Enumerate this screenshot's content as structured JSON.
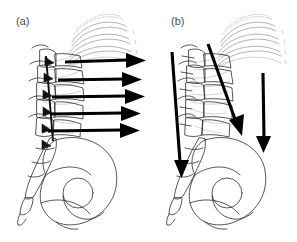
{
  "figure": {
    "background_color": "#ffffff",
    "width": 297,
    "height": 242,
    "panels": [
      {
        "id": "a",
        "label": "(a)",
        "label_color": "#4a4a4a",
        "description": "Lateral view of thoracolumbar spine, rib cage and pelvis with five horizontal force arrows directed posterior-to-anterior",
        "arrow_color": "#000000",
        "arrow_count": 5,
        "arrow_direction": "horizontal-right",
        "arrows": [
          {
            "name": "arrow-1",
            "x1": 65,
            "y1": 62,
            "x2": 143,
            "y2": 60
          },
          {
            "name": "arrow-2",
            "x1": 58,
            "y1": 80,
            "x2": 139,
            "y2": 79
          },
          {
            "name": "arrow-3",
            "x1": 52,
            "y1": 97,
            "x2": 142,
            "y2": 96
          },
          {
            "name": "arrow-4",
            "x1": 50,
            "y1": 114,
            "x2": 138,
            "y2": 113
          },
          {
            "name": "arrow-5",
            "x1": 48,
            "y1": 131,
            "x2": 137,
            "y2": 130
          }
        ]
      },
      {
        "id": "b",
        "label": "(b)",
        "label_color": "#4a4a4a",
        "description": "Lateral view of thoracolumbar spine, rib cage and pelvis with three downward-directed load arrows",
        "arrow_color": "#000000",
        "arrow_count": 3,
        "arrow_direction": "vertical-down",
        "arrows": [
          {
            "name": "arrow-left-vertical",
            "x1": 172,
            "y1": 52,
            "x2": 182,
            "y2": 176
          },
          {
            "name": "arrow-diagonal-spine",
            "x1": 208,
            "y1": 44,
            "x2": 241,
            "y2": 136
          },
          {
            "name": "arrow-right-vertical",
            "x1": 263,
            "y1": 73,
            "x2": 264,
            "y2": 152
          }
        ]
      }
    ],
    "anatomy": {
      "structures": [
        "ribs",
        "thoracic-vertebrae",
        "lumbar-vertebrae",
        "spinous-processes",
        "sacrum",
        "coccyx",
        "ilium",
        "acetabulum",
        "ischium",
        "pubis"
      ],
      "line_color": "#2b2b2b",
      "rib_color": "#9a9a9a"
    }
  }
}
